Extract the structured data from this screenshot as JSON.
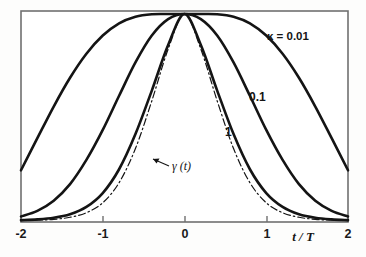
{
  "figure": {
    "background_color": "#fdfdfc",
    "frame_color": "#6e6e6e",
    "curve_color": "#141414",
    "axis_label": "t / T",
    "parameter_annotation": "κ = 0.01",
    "gamma_annotation": "γ (t)"
  },
  "chart_data": {
    "type": "line",
    "title": "",
    "subtitle": "",
    "xlabel": "t / T",
    "ylabel": "",
    "xlim": [
      -2,
      2
    ],
    "ylim": [
      0,
      1
    ],
    "grid": false,
    "legend_position": "inline-curve-labels",
    "xticks": [
      -2,
      -1,
      0,
      1,
      2
    ],
    "xtick_labels": [
      "-2",
      "-1",
      "0",
      "1",
      "2"
    ],
    "yticks": [],
    "ytick_labels": [],
    "annotations": [
      {
        "name": "kappa-value",
        "text": "κ = 0.01",
        "x": 1.52,
        "y": 0.905
      },
      {
        "name": "curve-label-0.1",
        "text": "0.1",
        "x": 0.83,
        "y": 0.6
      },
      {
        "name": "curve-label-1",
        "text": "1",
        "x": 0.53,
        "y": 0.43
      },
      {
        "name": "gamma-of-t",
        "text": "γ (t)",
        "x": -0.19,
        "y": 0.27
      }
    ],
    "x": [
      -2.0,
      -1.8,
      -1.6,
      -1.4,
      -1.2,
      -1.0,
      -0.8,
      -0.6,
      -0.4,
      -0.2,
      0.0,
      0.2,
      0.4,
      0.6,
      0.8,
      1.0,
      1.2,
      1.4,
      1.6,
      1.8,
      2.0
    ],
    "series": [
      {
        "name": "κ = 0.01",
        "label": "0.01",
        "style": "solid",
        "width": 2.6,
        "values": [
          0.245,
          0.4,
          0.553,
          0.692,
          0.808,
          0.896,
          0.955,
          0.987,
          0.999,
          1.0,
          1.0,
          1.0,
          0.999,
          0.987,
          0.955,
          0.896,
          0.808,
          0.692,
          0.553,
          0.4,
          0.245
        ]
      },
      {
        "name": "κ = 0.1",
        "label": "0.1",
        "style": "solid",
        "width": 2.6,
        "values": [
          0.022,
          0.049,
          0.098,
          0.178,
          0.295,
          0.44,
          0.605,
          0.766,
          0.896,
          0.975,
          1.0,
          0.975,
          0.896,
          0.766,
          0.605,
          0.44,
          0.295,
          0.178,
          0.098,
          0.049,
          0.022
        ]
      },
      {
        "name": "κ = 1",
        "label": "1",
        "style": "solid",
        "width": 2.6,
        "values": [
          0.004,
          0.008,
          0.016,
          0.033,
          0.068,
          0.135,
          0.25,
          0.42,
          0.63,
          0.85,
          1.0,
          0.85,
          0.63,
          0.42,
          0.25,
          0.135,
          0.068,
          0.033,
          0.016,
          0.008,
          0.004
        ]
      },
      {
        "name": "γ (t)",
        "label": "γ (t)",
        "style": "dash-dot",
        "width": 1.2,
        "values": [
          0.002,
          0.004,
          0.008,
          0.018,
          0.04,
          0.088,
          0.185,
          0.35,
          0.58,
          0.83,
          1.0,
          0.83,
          0.58,
          0.35,
          0.185,
          0.088,
          0.04,
          0.018,
          0.008,
          0.004,
          0.002
        ]
      }
    ]
  }
}
